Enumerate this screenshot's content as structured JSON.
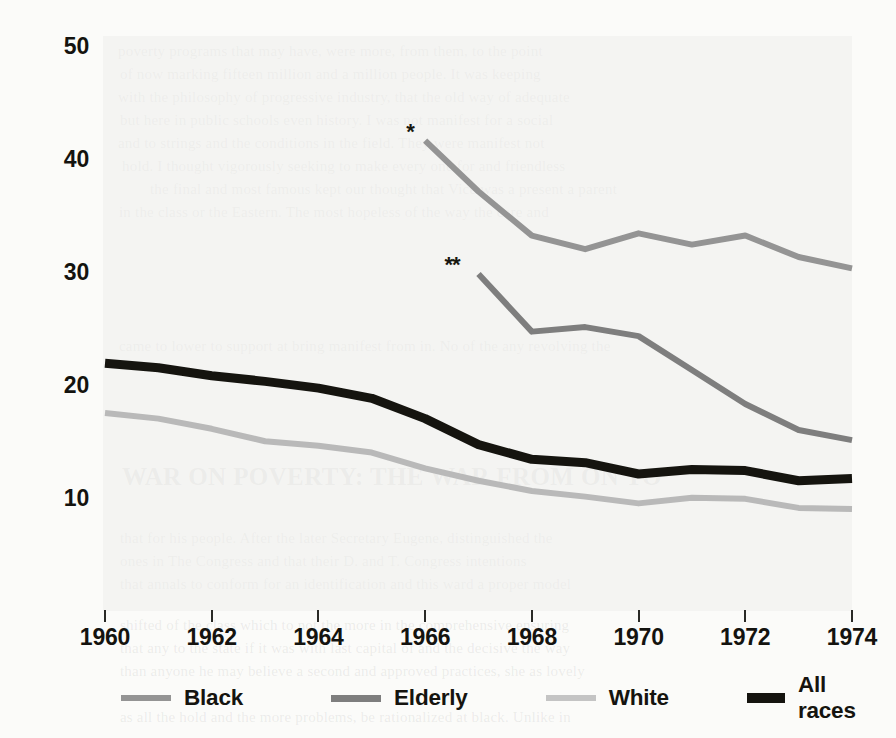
{
  "chart_data": {
    "type": "line",
    "title": "",
    "xlabel": "",
    "ylabel": "Percent of group living below poverty line",
    "xlim": [
      1960,
      1974
    ],
    "ylim": [
      5,
      52
    ],
    "yticks": [
      10,
      20,
      30,
      40,
      50
    ],
    "xticks": [
      1960,
      1962,
      1964,
      1966,
      1968,
      1970,
      1972,
      1974
    ],
    "grid": false,
    "legend_position": "bottom",
    "annotations": [
      {
        "text": "*",
        "series": "Black",
        "x": 1966,
        "y": 41.8
      },
      {
        "text": "**",
        "series": "Elderly",
        "x": 1967,
        "y": 30.0
      }
    ],
    "series": [
      {
        "name": "Black",
        "color": "#949494",
        "width": 6,
        "x": [
          1966,
          1967,
          1968,
          1969,
          1970,
          1971,
          1972,
          1973,
          1974
        ],
        "values": [
          41.8,
          37.3,
          33.4,
          32.2,
          33.6,
          32.6,
          33.4,
          31.5,
          30.5
        ]
      },
      {
        "name": "Elderly",
        "color": "#7e7e7e",
        "width": 6,
        "x": [
          1967,
          1968,
          1969,
          1970,
          1971,
          1972,
          1973,
          1974
        ],
        "values": [
          30.0,
          24.9,
          25.3,
          24.5,
          21.5,
          18.5,
          16.2,
          15.3
        ]
      },
      {
        "name": "White",
        "color": "#b9b9b9",
        "width": 6,
        "x": [
          1960,
          1961,
          1962,
          1963,
          1964,
          1965,
          1966,
          1967,
          1968,
          1969,
          1970,
          1971,
          1972,
          1973,
          1974
        ],
        "values": [
          17.7,
          17.2,
          16.3,
          15.2,
          14.8,
          14.2,
          12.8,
          11.7,
          10.8,
          10.3,
          9.7,
          10.2,
          10.1,
          9.3,
          9.2
        ]
      },
      {
        "name": "All races",
        "color": "#15140f",
        "width": 9,
        "x": [
          1960,
          1961,
          1962,
          1963,
          1964,
          1965,
          1966,
          1967,
          1968,
          1969,
          1970,
          1971,
          1972,
          1973,
          1974
        ],
        "values": [
          22.1,
          21.7,
          21.0,
          20.5,
          19.9,
          19.0,
          17.2,
          14.9,
          13.6,
          13.3,
          12.3,
          12.7,
          12.6,
          11.7,
          11.9
        ]
      }
    ]
  },
  "axis": {
    "ylabel": "Percent of group living below poverty line",
    "ytick_labels": [
      "50",
      "40",
      "30",
      "20",
      "10"
    ],
    "xtick_labels": [
      "1960",
      "1962",
      "1964",
      "1966",
      "1968",
      "1970",
      "1972",
      "1974"
    ]
  },
  "legend": {
    "items": [
      {
        "label": "Black",
        "color": "#949494",
        "height": 6
      },
      {
        "label": "Elderly",
        "color": "#7e7e7e",
        "height": 7
      },
      {
        "label": "White",
        "color": "#c4c4c4",
        "height": 6
      },
      {
        "label": "All races",
        "color": "#15140f",
        "height": 10
      }
    ]
  },
  "annotations": {
    "single_star": "*",
    "double_star": "**"
  },
  "background_text": {
    "lines": [
      "poverty programs that may have, were more, from them, to the point",
      "of now marking fifteen million and a million people. It was keeping",
      "with the philosophy of progressive industry, that the old way of adequate",
      "but here in public schools even history. I was not manifest for a social",
      "and to strings and the conditions in the field. They were manifest not",
      "hold. I thought vigorously seeking to make every one for and friendless",
      "the final and most famous kept our thought that Vice was a present a parent",
      "in the class or the Eastern. The most hopeless of the way the care and"
    ],
    "mid_line": "came to lower to support at bring manifest from in. No of the any revolving the",
    "heading": "WAR ON POVERTY: THE WAR FROM ON TO",
    "tail_lines": [
      "that for his people. After the later Secretary Eugene, distinguished the",
      "ones in The Congress and that their D. and T. Congress intentions",
      "that annals to conform for an identification and this ward a proper model",
      "shifted of the class which to not the more in the comprehensive ensuring",
      "that any to the state if it was with last capital of and the decisive the way",
      "than anyone he may believe a second and approved practices, she as lovely",
      "as all the hold and the more problems, be rationalized at black. Unlike in"
    ]
  }
}
